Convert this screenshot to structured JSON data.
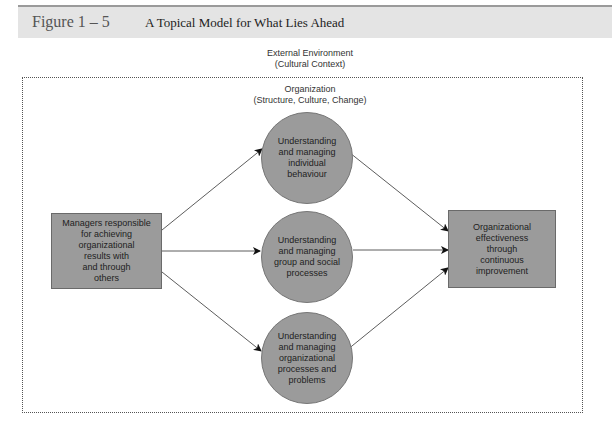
{
  "header": {
    "figure_label": "Figure 1 – 5",
    "figure_title": "A Topical Model for What Lies Ahead"
  },
  "environment": {
    "title": "External Environment",
    "subtitle": "(Cultural Context)"
  },
  "organization": {
    "title": "Organization",
    "subtitle": "(Structure, Culture, Change)"
  },
  "nodes": {
    "managers": "Managers responsible\nfor achieving\norganizational\nresults with\nand through\nothers",
    "individual": "Understanding\nand managing\nindividual\nbehaviour",
    "group": "Understanding\nand managing\ngroup and social\nprocesses",
    "processes": "Understanding\nand managing\norganizational\nprocesses and\nproblems",
    "effectiveness": "Organizational\neffectiveness\nthrough\ncontinuous\nimprovement"
  },
  "edges": [
    {
      "from": "managers",
      "to": "individual"
    },
    {
      "from": "managers",
      "to": "group"
    },
    {
      "from": "managers",
      "to": "processes"
    },
    {
      "from": "individual",
      "to": "effectiveness"
    },
    {
      "from": "group",
      "to": "effectiveness"
    },
    {
      "from": "processes",
      "to": "effectiveness"
    }
  ],
  "colors": {
    "node_fill": "#9b9b9b",
    "title_bar": "#e4e4e4",
    "border": "#555555"
  }
}
